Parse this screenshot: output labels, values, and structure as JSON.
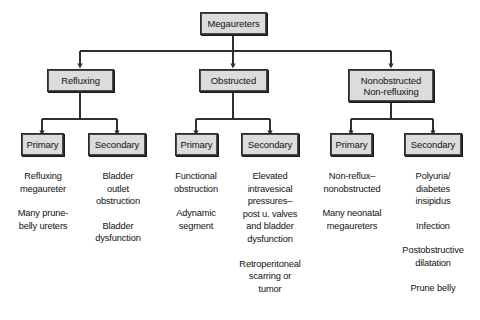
{
  "figure": {
    "colors": {
      "box_fill": "#dcdcdc",
      "box_border": "#2a2a2a",
      "line": "#303030",
      "text": "#111111",
      "background": "#ffffff"
    }
  },
  "root": {
    "label": "Megaureters"
  },
  "categories": [
    {
      "label": "Refluxing"
    },
    {
      "label": "Obstructed"
    },
    {
      "label": "Nonobstructed\nNon-refluxing"
    }
  ],
  "subtypes": [
    {
      "label": "Primary"
    },
    {
      "label": "Secondary"
    },
    {
      "label": "Primary"
    },
    {
      "label": "Secondary"
    },
    {
      "label": "Primary"
    },
    {
      "label": "Secondary"
    }
  ],
  "leaf_columns": [
    {
      "column": "refluxing-primary",
      "items": [
        "Refluxing\nmegaureter",
        "Many prune-\nbelly ureters"
      ]
    },
    {
      "column": "refluxing-secondary",
      "items": [
        "Bladder\noutlet\nobstruction",
        "Bladder\ndysfunction"
      ]
    },
    {
      "column": "obstructed-primary",
      "items": [
        "Functional\nobstruction",
        "Adynamic\nsegment"
      ]
    },
    {
      "column": "obstructed-secondary",
      "items": [
        "Elevated\nintravesical\npressures–\npost u. valves\nand bladder\ndysfunction",
        "Retroperitoneal\nscarring or\ntumor"
      ]
    },
    {
      "column": "nonobstructed-primary",
      "items": [
        "Non-reflux–\nnonobstructed",
        "Many neonatal\nmegaureters"
      ]
    },
    {
      "column": "nonobstructed-secondary",
      "items": [
        "Polyuria/\ndiabetes\ninsipidus",
        "Infection",
        "Postobstructive\ndilatation",
        "Prune belly"
      ]
    }
  ]
}
